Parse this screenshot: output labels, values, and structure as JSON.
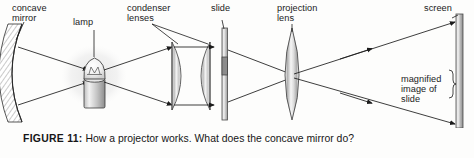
{
  "figure": {
    "caption_label": "FIGURE 11:",
    "caption_text": " How a projector works. What does the concave mirror do?"
  },
  "labels": {
    "concave_mirror": "concave\nmirror",
    "lamp": "lamp",
    "condenser_lenses": "condenser\nlenses",
    "slide": "slide",
    "projection_lens": "projection\nlens",
    "screen": "screen",
    "magnified_image_of_slide": "magnified\nimage of\nslide"
  },
  "colors": {
    "background": "#fdfdfc",
    "ink": "#1b1b1b",
    "caption_ink": "#161616",
    "glass_light": "#f2f2f2",
    "glass_mid": "#c9c9c9",
    "glass_dark": "#8f8f8f",
    "glow": "#ebebeb",
    "screen_gray": "#b5b5b5",
    "metal_light": "#efefef",
    "metal_dark": "#9a9a9a"
  }
}
